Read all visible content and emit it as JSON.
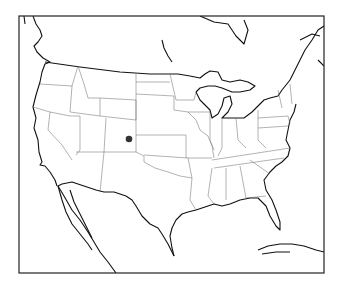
{
  "map": {
    "region": "Contiguous United States",
    "projection": "conic",
    "frame": {
      "x": 19,
      "y": 16,
      "width": 305,
      "height": 257
    },
    "colors": {
      "background": "#ffffff",
      "coastline": "#111111",
      "state_borders": "#666666",
      "marker": "#333333"
    },
    "markers": [
      {
        "label": "",
        "state": "Colorado",
        "x": 129,
        "y": 139,
        "r": 3.3
      }
    ]
  }
}
